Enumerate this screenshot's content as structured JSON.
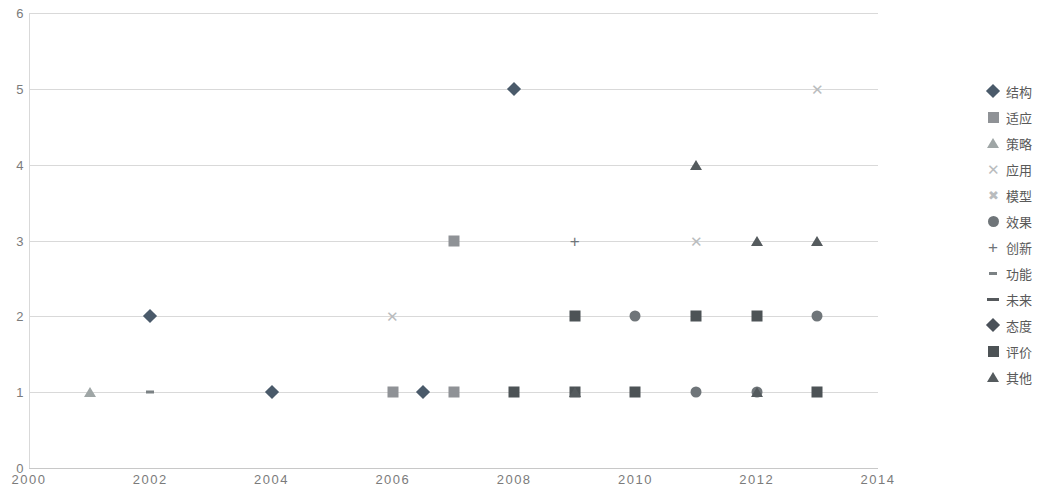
{
  "chart_data": {
    "type": "scatter",
    "title": "",
    "xlabel": "",
    "ylabel": "",
    "xlim": [
      2000,
      2014
    ],
    "ylim": [
      0,
      6
    ],
    "x_ticks": [
      "2000",
      "2002",
      "2004",
      "2006",
      "2008",
      "2010",
      "2012",
      "2014"
    ],
    "x_tick_values": [
      2000,
      2002,
      2004,
      2006,
      2008,
      2010,
      2012,
      2014
    ],
    "y_ticks": [
      "0",
      "1",
      "2",
      "3",
      "4",
      "5",
      "6"
    ],
    "y_tick_values": [
      0,
      1,
      2,
      3,
      4,
      5,
      6
    ],
    "grid": "horizontal",
    "legend_position": "right",
    "series": [
      {
        "name": "结构",
        "marker": "diamond",
        "color": "#4a5a6a",
        "points": [
          {
            "x": 2002,
            "y": 2
          },
          {
            "x": 2004,
            "y": 1
          },
          {
            "x": 2006.5,
            "y": 1
          },
          {
            "x": 2008,
            "y": 5
          }
        ]
      },
      {
        "name": "适应",
        "marker": "square",
        "color": "#8f9296",
        "points": [
          {
            "x": 2006,
            "y": 1
          },
          {
            "x": 2007,
            "y": 3
          },
          {
            "x": 2007,
            "y": 1
          }
        ]
      },
      {
        "name": "策略",
        "marker": "triangle",
        "color": "#9fa6a6",
        "points": [
          {
            "x": 2001,
            "y": 1
          }
        ]
      },
      {
        "name": "应用",
        "marker": "x-cross",
        "color": "#b9bcbe",
        "points": [
          {
            "x": 2006,
            "y": 2
          },
          {
            "x": 2011,
            "y": 3
          },
          {
            "x": 2013,
            "y": 5
          }
        ]
      },
      {
        "name": "模型",
        "marker": "x-star",
        "color": "#b9bcbe",
        "points": []
      },
      {
        "name": "效果",
        "marker": "circle",
        "color": "#6f7579",
        "points": [
          {
            "x": 2010,
            "y": 2
          },
          {
            "x": 2011,
            "y": 1
          },
          {
            "x": 2012,
            "y": 1
          },
          {
            "x": 2013,
            "y": 2
          }
        ]
      },
      {
        "name": "创新",
        "marker": "plus",
        "color": "#6f7579",
        "points": [
          {
            "x": 2009,
            "y": 3
          },
          {
            "x": 2012,
            "y": 2
          }
        ]
      },
      {
        "name": "功能",
        "marker": "dash-small",
        "color": "#7b8184",
        "points": [
          {
            "x": 2002,
            "y": 1
          }
        ]
      },
      {
        "name": "未来",
        "marker": "dash-large",
        "color": "#55595c",
        "points": []
      },
      {
        "name": "态度",
        "marker": "diamond",
        "color": "#4a5159",
        "points": []
      },
      {
        "name": "评价",
        "marker": "square",
        "color": "#4d5356",
        "points": [
          {
            "x": 2008,
            "y": 1
          },
          {
            "x": 2009,
            "y": 2
          },
          {
            "x": 2009,
            "y": 1
          },
          {
            "x": 2010,
            "y": 1
          },
          {
            "x": 2011,
            "y": 2
          },
          {
            "x": 2012,
            "y": 2
          },
          {
            "x": 2013,
            "y": 1
          }
        ]
      },
      {
        "name": "其他",
        "marker": "triangle",
        "color": "#555b5e",
        "points": [
          {
            "x": 2009,
            "y": 1
          },
          {
            "x": 2011,
            "y": 4
          },
          {
            "x": 2012,
            "y": 3
          },
          {
            "x": 2012,
            "y": 1
          },
          {
            "x": 2013,
            "y": 3
          }
        ]
      }
    ]
  },
  "legend": {
    "items": [
      {
        "label": "结构",
        "marker": "diamond",
        "color": "#4a5a6a"
      },
      {
        "label": "适应",
        "marker": "square",
        "color": "#8f9296"
      },
      {
        "label": "策略",
        "marker": "triangle",
        "color": "#9fa6a6"
      },
      {
        "label": "应用",
        "marker": "x-cross",
        "color": "#b9bcbe"
      },
      {
        "label": "模型",
        "marker": "x-star",
        "color": "#b9bcbe"
      },
      {
        "label": "效果",
        "marker": "circle",
        "color": "#6f7579"
      },
      {
        "label": "创新",
        "marker": "plus",
        "color": "#6f7579"
      },
      {
        "label": "功能",
        "marker": "dash-small",
        "color": "#7b8184"
      },
      {
        "label": "未来",
        "marker": "dash-large",
        "color": "#55595c"
      },
      {
        "label": "态度",
        "marker": "diamond",
        "color": "#4a5159"
      },
      {
        "label": "评价",
        "marker": "square",
        "color": "#4d5356"
      },
      {
        "label": "其他",
        "marker": "triangle",
        "color": "#555b5e"
      }
    ]
  },
  "colors": {
    "grid": "#d9d9d9",
    "axis_text": "#7b7b7b",
    "legend_text": "#595959",
    "background": "#ffffff"
  }
}
